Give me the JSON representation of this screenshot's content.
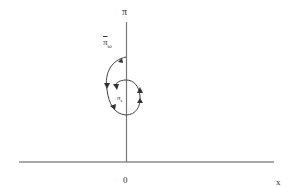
{
  "diagram": {
    "labels": {
      "top_axis": "π",
      "outer_label": "π",
      "outer_sub": "ω",
      "inner_label": "π",
      "inner_sub": "s",
      "origin": "0",
      "x_axis": "x"
    },
    "colors": {
      "line": "#444444",
      "background": "#ffffff"
    }
  }
}
